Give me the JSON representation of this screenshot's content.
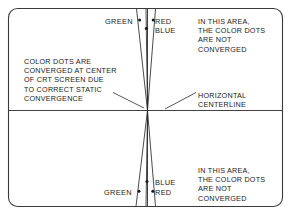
{
  "figure": {
    "frame_color": "#3a3a3a",
    "line_color": "#2b2b2b",
    "text_color": "#1a1a1a"
  },
  "notes": {
    "left": "COLOR DOTS ARE\nCONVERGED AT CENTER\nOF CRT SCREEN DUE\nTO CORRECT STATIC\nCONVERGENCE",
    "top_right": "IN THIS AREA,\nTHE COLOR DOTS\nARE NOT\nCONVERGED",
    "bottom_right": "IN THIS AREA,\nTHE COLOR DOTS\nARE NOT\nCONVERGED",
    "centerline": "HORIZONTAL\nCENTERLINE"
  },
  "labels": {
    "green_top": "GREEN",
    "red_top": "RED",
    "blue_top": "BLUE",
    "blue_bottom": "BLUE",
    "green_bottom": "GREEN",
    "red_bottom": "RED"
  }
}
